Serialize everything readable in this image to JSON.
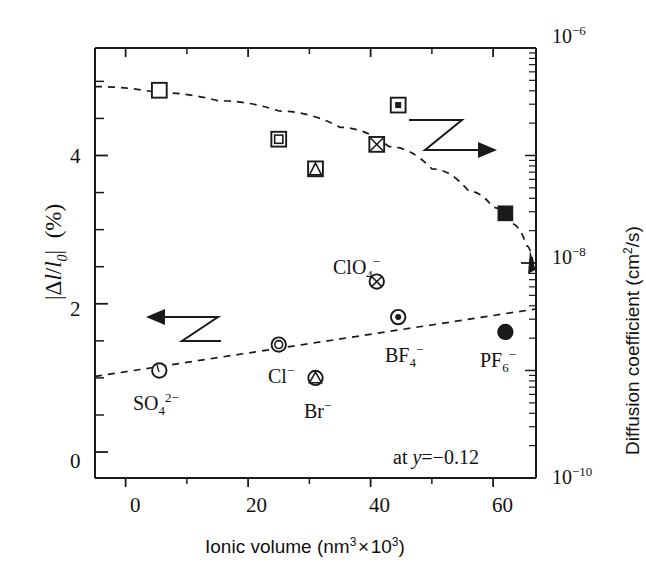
{
  "chart_data": {
    "type": "scatter",
    "title": "",
    "xlabel": "Ionic volume (nm3 x 103)",
    "xlabel_parts": {
      "base": "Ionic volume (nm",
      "sup1": "3",
      "mid": " × 10",
      "sup2": "3",
      "close": ")"
    },
    "ylabel_left": "|Δl/l0| (%)",
    "ylabel_right": "Diffusion coefficient (cm2/s)",
    "ylabel_right_parts": {
      "base": "Diffusion coefficient (cm",
      "sup": "2",
      "close": "/s)"
    },
    "xlim": [
      -5,
      67
    ],
    "xticks": [
      0,
      20,
      40,
      60
    ],
    "xtick_labels": [
      "0",
      "20",
      "40",
      "60"
    ],
    "x_minor_ticks": [
      10,
      30,
      50
    ],
    "ylim_left": [
      -0.35,
      5.45
    ],
    "yticks_left": [
      0,
      2,
      4
    ],
    "ytick_labels_left": [
      "0",
      "2",
      "4"
    ],
    "y_minor_left": [
      0.5,
      1,
      1.5,
      2.5,
      3,
      3.5,
      4.5,
      5
    ],
    "ylim_right_log": [
      -10,
      -6
    ],
    "yticks_right": [
      -6,
      -8,
      -10
    ],
    "ytick_labels_right": [
      "10−6",
      "10−8",
      "10−10"
    ],
    "right_axis_scale": "log",
    "grid": false,
    "legend_position": "none",
    "annotation": "at y = −0.12",
    "annotation_parts": {
      "prefix": "at ",
      "italic": "y",
      "rest": "= −0.12"
    },
    "arrow_left_note": "left-pointing zigzag arrow indicating open-circle series reads left axis",
    "arrow_right_note": "right-pointing zigzag arrow indicating square series reads right axis",
    "series": [
      {
        "name": "Strain |Δl/l0| (%)",
        "axis": "left",
        "marker_family": "circle",
        "trend": "dashed increasing line",
        "points": [
          {
            "ion": "SO4 2-",
            "ion_label": "SO",
            "ion_sub": "4",
            "ion_sup": "2−",
            "x": 5.5,
            "y": 1.1,
            "marker": "open-circle"
          },
          {
            "ion": "Cl-",
            "ion_label": "Cl",
            "ion_sub": "",
            "ion_sup": "−",
            "x": 25.0,
            "y": 1.45,
            "marker": "double-circle"
          },
          {
            "ion": "Br-",
            "ion_label": "Br",
            "ion_sub": "",
            "ion_sup": "−",
            "x": 31.0,
            "y": 1.0,
            "marker": "circle-triangle"
          },
          {
            "ion": "ClO4 -",
            "ion_label": "ClO",
            "ion_sub": "4",
            "ion_sup": "−",
            "x": 41.0,
            "y": 2.3,
            "marker": "circle-cross"
          },
          {
            "ion": "BF4 -",
            "ion_label": "BF",
            "ion_sub": "4",
            "ion_sup": "−",
            "x": 44.5,
            "y": 1.82,
            "marker": "circle-dot"
          },
          {
            "ion": "PF6 -",
            "ion_label": "PF",
            "ion_sub": "6",
            "ion_sup": "−",
            "x": 62.0,
            "y": 1.62,
            "marker": "filled-circle"
          }
        ],
        "trendline": [
          {
            "x": -5,
            "y": 1.02
          },
          {
            "x": 67,
            "y": 1.93
          }
        ]
      },
      {
        "name": "Diffusion coefficient (cm2/s)",
        "axis": "right",
        "marker_family": "square",
        "trend": "dashed decreasing curve",
        "points": [
          {
            "ion": "SO4 2-",
            "x": 5.5,
            "y_left_equiv": 4.88,
            "D": 4e-07,
            "marker": "open-square"
          },
          {
            "ion": "Cl-",
            "x": 25.0,
            "y_left_equiv": 4.22,
            "D": 2.6e-07,
            "marker": "double-square"
          },
          {
            "ion": "Br-",
            "x": 31.0,
            "y_left_equiv": 3.82,
            "D": 2e-07,
            "marker": "square-triangle"
          },
          {
            "ion": "ClO4 -",
            "x": 41.0,
            "y_left_equiv": 4.15,
            "D": 2.5e-07,
            "marker": "square-cross"
          },
          {
            "ion": "BF4 -",
            "x": 44.5,
            "y_left_equiv": 4.68,
            "D": 3.5e-07,
            "marker": "square-dot"
          },
          {
            "ion": "PF6 -",
            "x": 62.0,
            "y_left_equiv": 3.22,
            "D": 1.2e-07,
            "marker": "filled-square"
          }
        ],
        "trendline_note": "dashed curve from upper-left sloping gently then falling steeply past x=50"
      }
    ]
  },
  "figure": {
    "line_color": "#1a1a1a",
    "marker_color": "#1a1a1a",
    "background": "#ffffff"
  }
}
